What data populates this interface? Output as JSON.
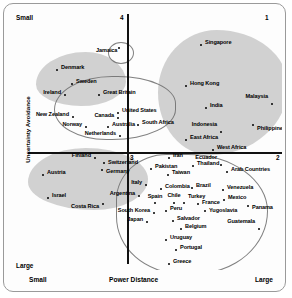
{
  "chart_data": {
    "type": "scatter",
    "title": "",
    "xlabel": "Power Distance",
    "ylabel": "Uncertainty Avoidance",
    "xlim": [
      0,
      100
    ],
    "ylim": [
      0,
      100
    ],
    "grid": false,
    "legend": "none",
    "axis_corner_labels": {
      "top_left": "Small",
      "bottom_left_y": "Large",
      "bottom_left_x": "Small",
      "bottom_right_x": "Large"
    },
    "quadrant_numbers": [
      "1",
      "2",
      "3",
      "4"
    ],
    "quadrants": [
      {
        "number": "4",
        "position": "top-center"
      },
      {
        "number": "1",
        "position": "top-right"
      },
      {
        "number": "3",
        "position": "center-left-below-axis"
      },
      {
        "number": "2",
        "position": "right-of-horizontal-axis"
      }
    ],
    "categories": [
      "Jamaica",
      "Denmark",
      "Sweden",
      "Ireland",
      "Great Britain",
      "New Zealand",
      "Canada",
      "United States",
      "Norway",
      "Australia",
      "South Africa",
      "Netherlands",
      "Finland",
      "Switzerland",
      "Germany",
      "Austria",
      "Israel",
      "Costa Rica",
      "Italy",
      "Argentina",
      "Spain",
      "South Korea",
      "Japan",
      "Singapore",
      "Hong Kong",
      "India",
      "Malaysia",
      "Indonesia",
      "Philippines",
      "East Africa",
      "West Africa",
      "Iran",
      "Pakistan",
      "Thailand",
      "Taiwan",
      "Ecuador",
      "Arab Countries",
      "Colombia",
      "Brazil",
      "Venezuela",
      "Chile",
      "Turkey",
      "Mexico",
      "France",
      "Peru",
      "Yugoslavia",
      "Panama",
      "Salvador",
      "Belgium",
      "Guatemala",
      "Uruguay",
      "Portugal",
      "Greece"
    ],
    "points": [
      {
        "name": "Jamaica",
        "x": 111,
        "y": 40,
        "lx": 88,
        "ly": 43,
        "align": "left"
      },
      {
        "name": "Denmark",
        "x": 49,
        "y": 62,
        "lx": 53,
        "ly": 60,
        "align": "left"
      },
      {
        "name": "Sweden",
        "x": 64,
        "y": 76,
        "lx": 68,
        "ly": 74,
        "align": "left"
      },
      {
        "name": "Ireland",
        "x": 57,
        "y": 87,
        "lx": 53,
        "ly": 85,
        "align": "right"
      },
      {
        "name": "Great Britain",
        "x": 91,
        "y": 87,
        "lx": 95,
        "ly": 85,
        "align": "left"
      },
      {
        "name": "New Zealand",
        "x": 65,
        "y": 109,
        "lx": 61,
        "ly": 107,
        "align": "right"
      },
      {
        "name": "Canada",
        "x": 110,
        "y": 110,
        "lx": 106,
        "ly": 108,
        "align": "right"
      },
      {
        "name": "United States",
        "x": 110,
        "y": 105,
        "lx": 114,
        "ly": 103,
        "align": "left"
      },
      {
        "name": "Norway",
        "x": 78,
        "y": 119,
        "lx": 74,
        "ly": 117,
        "align": "right"
      },
      {
        "name": "Australia",
        "x": 100,
        "y": 119,
        "lx": 104,
        "ly": 117,
        "align": "left"
      },
      {
        "name": "South Africa",
        "x": 130,
        "y": 117,
        "lx": 134,
        "ly": 115,
        "align": "left"
      },
      {
        "name": "Netherlands",
        "x": 112,
        "y": 128,
        "lx": 108,
        "ly": 126,
        "align": "right"
      },
      {
        "name": "Finland",
        "x": 87,
        "y": 150,
        "lx": 83,
        "ly": 148,
        "align": "right"
      },
      {
        "name": "Switzerland",
        "x": 96,
        "y": 155,
        "lx": 100,
        "ly": 155,
        "align": "left"
      },
      {
        "name": "Germany",
        "x": 94,
        "y": 162,
        "lx": 98,
        "ly": 164,
        "align": "left"
      },
      {
        "name": "Austria",
        "x": 35,
        "y": 167,
        "lx": 39,
        "ly": 165,
        "align": "left"
      },
      {
        "name": "Israel",
        "x": 40,
        "y": 190,
        "lx": 44,
        "ly": 188,
        "align": "left"
      },
      {
        "name": "Costa Rica",
        "x": 95,
        "y": 196,
        "lx": 91,
        "ly": 199,
        "align": "right"
      },
      {
        "name": "Italy",
        "x": 138,
        "y": 177,
        "lx": 134,
        "ly": 175,
        "align": "right"
      },
      {
        "name": "Argentina",
        "x": 131,
        "y": 188,
        "lx": 127,
        "ly": 186,
        "align": "right"
      },
      {
        "name": "Spain",
        "x": 147,
        "y": 195,
        "lx": 147,
        "ly": 189,
        "align": "center"
      },
      {
        "name": "South Korea",
        "x": 146,
        "y": 205,
        "lx": 142,
        "ly": 203,
        "align": "right"
      },
      {
        "name": "Japan",
        "x": 139,
        "y": 214,
        "lx": 135,
        "ly": 212,
        "align": "right"
      },
      {
        "name": "Singapore",
        "x": 193,
        "y": 37,
        "lx": 197,
        "ly": 35,
        "align": "left"
      },
      {
        "name": "Hong Kong",
        "x": 178,
        "y": 78,
        "lx": 182,
        "ly": 76,
        "align": "left"
      },
      {
        "name": "India",
        "x": 198,
        "y": 100,
        "lx": 202,
        "ly": 98,
        "align": "left"
      },
      {
        "name": "Malaysia",
        "x": 264,
        "y": 96,
        "lx": 260,
        "ly": 89,
        "align": "right"
      },
      {
        "name": "Indonesia",
        "x": 213,
        "y": 124,
        "lx": 209,
        "ly": 117,
        "align": "right"
      },
      {
        "name": "Philippines",
        "x": 245,
        "y": 117,
        "lx": 249,
        "ly": 121,
        "align": "left"
      },
      {
        "name": "East Africa",
        "x": 178,
        "y": 132,
        "lx": 182,
        "ly": 130,
        "align": "left"
      },
      {
        "name": "West Africa",
        "x": 205,
        "y": 142,
        "lx": 209,
        "ly": 140,
        "align": "left"
      },
      {
        "name": "Iran",
        "x": 161,
        "y": 150,
        "lx": 165,
        "ly": 148,
        "align": "left"
      },
      {
        "name": "Pakistan",
        "x": 143,
        "y": 161,
        "lx": 147,
        "ly": 159,
        "align": "left"
      },
      {
        "name": "Thailand",
        "x": 185,
        "y": 158,
        "lx": 189,
        "ly": 156,
        "align": "left"
      },
      {
        "name": "Taiwan",
        "x": 160,
        "y": 167,
        "lx": 164,
        "ly": 165,
        "align": "left"
      },
      {
        "name": "Ecuador",
        "x": 213,
        "y": 157,
        "lx": 209,
        "ly": 150,
        "align": "right"
      },
      {
        "name": "Arab Countries",
        "x": 219,
        "y": 164,
        "lx": 223,
        "ly": 162,
        "align": "left"
      },
      {
        "name": "Colombia",
        "x": 153,
        "y": 181,
        "lx": 157,
        "ly": 179,
        "align": "left"
      },
      {
        "name": "Brazil",
        "x": 184,
        "y": 180,
        "lx": 188,
        "ly": 178,
        "align": "left"
      },
      {
        "name": "Venezuela",
        "x": 215,
        "y": 182,
        "lx": 219,
        "ly": 180,
        "align": "left"
      },
      {
        "name": "Chile",
        "x": 166,
        "y": 195,
        "lx": 166,
        "ly": 188,
        "align": "center"
      },
      {
        "name": "Turkey",
        "x": 176,
        "y": 195,
        "lx": 180,
        "ly": 189,
        "align": "left"
      },
      {
        "name": "Mexico",
        "x": 216,
        "y": 192,
        "lx": 220,
        "ly": 190,
        "align": "left"
      },
      {
        "name": "France",
        "x": 190,
        "y": 196,
        "lx": 194,
        "ly": 195,
        "align": "left"
      },
      {
        "name": "Peru",
        "x": 158,
        "y": 203,
        "lx": 162,
        "ly": 201,
        "align": "left"
      },
      {
        "name": "Yugoslavia",
        "x": 197,
        "y": 203,
        "lx": 201,
        "ly": 203,
        "align": "left"
      },
      {
        "name": "Panama",
        "x": 240,
        "y": 198,
        "lx": 244,
        "ly": 200,
        "align": "left"
      },
      {
        "name": "Salvador",
        "x": 165,
        "y": 213,
        "lx": 169,
        "ly": 211,
        "align": "left"
      },
      {
        "name": "Belgium",
        "x": 173,
        "y": 221,
        "lx": 177,
        "ly": 219,
        "align": "left"
      },
      {
        "name": "Guatemala",
        "x": 251,
        "y": 221,
        "lx": 247,
        "ly": 214,
        "align": "right"
      },
      {
        "name": "Uruguay",
        "x": 158,
        "y": 232,
        "lx": 162,
        "ly": 230,
        "align": "left"
      },
      {
        "name": "Portugal",
        "x": 168,
        "y": 242,
        "lx": 172,
        "ly": 240,
        "align": "left"
      },
      {
        "name": "Greece",
        "x": 161,
        "y": 256,
        "lx": 165,
        "ly": 254,
        "align": "left"
      }
    ]
  },
  "axes": {
    "x_title": "Power Distance",
    "y_title": "Uncertainty Avoidance",
    "x_left_label": "Small",
    "x_right_label": "Large",
    "y_top_label": "Small",
    "y_bottom_label": "Large"
  },
  "quadrant_labels": {
    "q1": "1",
    "q2": "2",
    "q3": "3",
    "q4": "4"
  }
}
